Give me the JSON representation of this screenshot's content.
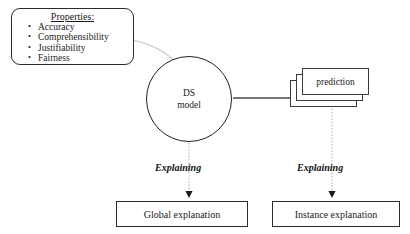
{
  "diagram": {
    "background_color": "#ffffff",
    "stroke_color": "#2b2b2b",
    "faint_stroke_color": "#c9c9c9"
  },
  "properties_box": {
    "heading": "Properties:",
    "items": [
      {
        "label": "Accuracy"
      },
      {
        "label": "Comprehensibility"
      },
      {
        "label": "Justifiability"
      },
      {
        "label": "Fairness"
      }
    ]
  },
  "model_node": {
    "line1": "DS",
    "line2": "model"
  },
  "prediction_stack": {
    "label": "prediction",
    "card_count": 3
  },
  "edges": {
    "model_to_prediction": "solid-arrow-right",
    "properties_to_model": "faint-connector",
    "model_to_global": "dotted-arrow-down",
    "prediction_to_instance": "dotted-arrow-down"
  },
  "explaining_labels": {
    "global": "Explaining",
    "instance": "Explaining"
  },
  "outcomes": {
    "global": "Global explanation",
    "instance": "Instance explanation"
  }
}
